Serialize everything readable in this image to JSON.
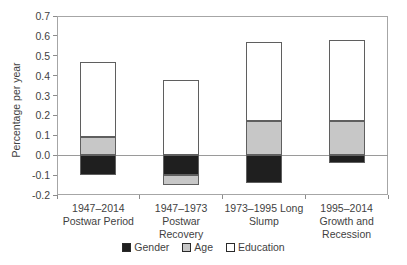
{
  "chart_data": {
    "type": "bar",
    "stacked": true,
    "title": "",
    "xlabel": "",
    "ylabel": "Percentage per year",
    "ylim": [
      -0.2,
      0.7
    ],
    "ytick_labels": [
      "0.7",
      "0.6",
      "0.5",
      "0.4",
      "0.3",
      "0.2",
      "0.1",
      "0.0",
      "-0.1",
      "-0.2"
    ],
    "grid": false,
    "legend_position": "bottom",
    "categories": [
      "1947–2014 Postwar Period",
      "1947–1973 Postwar Recovery",
      "1973–1995 Long Slump",
      "1995–2014 Growth and Recession"
    ],
    "category_label_lines": [
      [
        "1947–2014",
        "Postwar Period"
      ],
      [
        "1947–1973",
        "Postwar",
        "Recovery"
      ],
      [
        "1973–1995 Long",
        "Slump"
      ],
      [
        "1995–2014",
        "Growth and",
        "Recession"
      ]
    ],
    "series": [
      {
        "name": "Gender",
        "color": "#1f1f1f",
        "values": [
          -0.1,
          -0.1,
          -0.14,
          -0.04
        ]
      },
      {
        "name": "Age",
        "color": "#c7c7c7",
        "values": [
          0.09,
          -0.05,
          0.17,
          0.17
        ]
      },
      {
        "name": "Education",
        "color": "#ffffff",
        "values": [
          0.38,
          0.38,
          0.4,
          0.41
        ]
      }
    ],
    "colors": {
      "axis_line": "#a6a6a6",
      "tick": "#8c8c8c",
      "zero_line": "#9a9a9a",
      "text": "#3f3f3f"
    }
  }
}
